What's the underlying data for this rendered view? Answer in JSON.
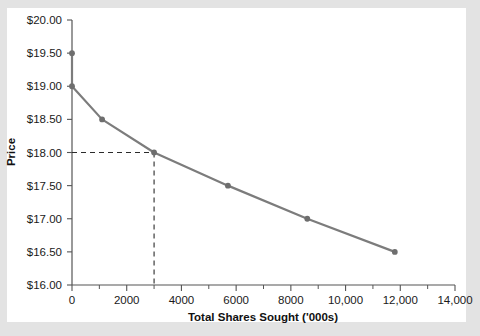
{
  "chart_data": {
    "type": "line",
    "title": "",
    "xlabel": "Total Shares Sought ('000s)",
    "ylabel": "Price",
    "xlim": [
      0,
      14000
    ],
    "ylim": [
      16.0,
      20.0
    ],
    "grid": false,
    "legend": "none",
    "x": [
      0,
      0,
      1100,
      3000,
      5700,
      8600,
      11800
    ],
    "values": [
      19.5,
      19.0,
      18.5,
      18.0,
      17.5,
      17.0,
      16.5
    ],
    "points": [
      {
        "x": 0,
        "y": 19.5
      },
      {
        "x": 0,
        "y": 19.0
      },
      {
        "x": 1100,
        "y": 18.5
      },
      {
        "x": 3000,
        "y": 18.0
      },
      {
        "x": 5700,
        "y": 17.5
      },
      {
        "x": 8600,
        "y": 17.0
      },
      {
        "x": 11800,
        "y": 16.5
      }
    ],
    "x_tick_labels": [
      "0",
      "2000",
      "4000",
      "6000",
      "8000",
      "10,000",
      "12,000",
      "14,000"
    ],
    "x_tick_values": [
      0,
      2000,
      4000,
      6000,
      8000,
      10000,
      12000,
      14000
    ],
    "x_minor_tick_values": [
      1000,
      3000,
      5000,
      7000,
      9000,
      11000,
      13000
    ],
    "y_tick_labels": [
      "$20.00",
      "$19.50",
      "$19.00",
      "$18.50",
      "$18.00",
      "$17.50",
      "$17.00",
      "$16.50",
      "$16.00"
    ],
    "y_tick_values": [
      20.0,
      19.5,
      19.0,
      18.5,
      18.0,
      17.5,
      17.0,
      16.5,
      16.0
    ],
    "annotations": [
      {
        "name": "price-guide",
        "type": "dashed-crosshair",
        "x": 3000,
        "y": 18.0
      }
    ],
    "series_color": "#7c7c7c",
    "marker_color": "#6e6e6e",
    "axis_color": "#555555",
    "text_color": "#1a1a1a"
  }
}
